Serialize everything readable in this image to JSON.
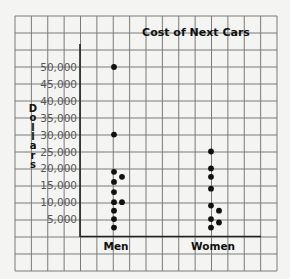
{
  "chart_data": {
    "type": "scatter",
    "subtype": "dot-plot",
    "title": "Cost of Next Cars",
    "xlabel": "",
    "ylabel": "Dollars",
    "categories": [
      "Men",
      "Women"
    ],
    "y_ticks": [
      5000,
      10000,
      15000,
      20000,
      25000,
      30000,
      35000,
      40000,
      45000,
      50000
    ],
    "y_tick_labels": [
      "5,000",
      "10,000",
      "15,000",
      "20,000",
      "25,000",
      "30,000",
      "35,000",
      "40,000",
      "45,000",
      "50,000"
    ],
    "ylim": [
      0,
      50000
    ],
    "grid": true,
    "series": [
      {
        "name": "Men",
        "points": [
          {
            "value": 50000,
            "offset": 0
          },
          {
            "value": 30000,
            "offset": 0
          },
          {
            "value": 19000,
            "offset": 0
          },
          {
            "value": 17500,
            "offset": 1
          },
          {
            "value": 16000,
            "offset": 0
          },
          {
            "value": 13000,
            "offset": 0
          },
          {
            "value": 10000,
            "offset": 0
          },
          {
            "value": 10000,
            "offset": 1
          },
          {
            "value": 7500,
            "offset": 0
          },
          {
            "value": 5000,
            "offset": 0
          },
          {
            "value": 2500,
            "offset": 0
          }
        ]
      },
      {
        "name": "Women",
        "points": [
          {
            "value": 25000,
            "offset": 0
          },
          {
            "value": 20000,
            "offset": 0
          },
          {
            "value": 17500,
            "offset": 0
          },
          {
            "value": 14000,
            "offset": 0
          },
          {
            "value": 9000,
            "offset": 0
          },
          {
            "value": 7500,
            "offset": 1
          },
          {
            "value": 5000,
            "offset": 0
          },
          {
            "value": 4000,
            "offset": 1
          },
          {
            "value": 2500,
            "offset": 0
          }
        ]
      }
    ]
  },
  "colors": {
    "background": "#f4f4f2",
    "grid": "#7a7a7a",
    "axis": "#222222",
    "dot": "#111111",
    "text": "#111111",
    "tick_text": "#555555"
  }
}
